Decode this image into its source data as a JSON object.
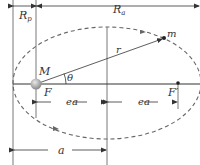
{
  "diagram": {
    "labels": {
      "rp": "R",
      "rp_sub": "p",
      "ra": "R",
      "ra_sub": "a",
      "central_body": "M",
      "orbiting_body": "m",
      "focus": "F",
      "empty_focus": "F′",
      "radius": "r",
      "angle": "θ",
      "ea_left": "ea",
      "ea_right": "ea",
      "semi_major": "a"
    },
    "colors": {
      "line": "#333333",
      "orbit": "#666666",
      "planet": "#b0b0b0"
    }
  }
}
